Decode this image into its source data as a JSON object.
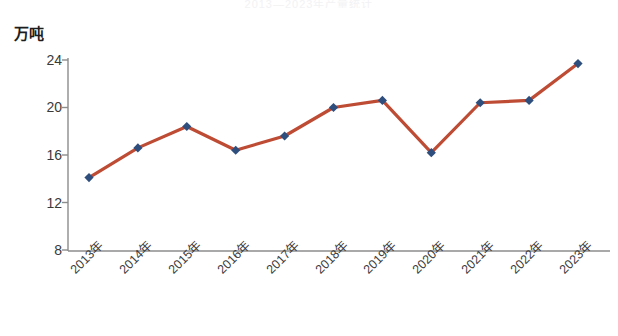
{
  "title_sliver": "2013—2023年产量统计",
  "axis": {
    "y_unit_label": "万吨",
    "y_ticks": [
      "24",
      "20",
      "16",
      "12",
      "8"
    ],
    "x_ticks": [
      "2013年",
      "2014年",
      "2015年",
      "2016年",
      "2017年",
      "2018年",
      "2019年",
      "2020年",
      "2021年",
      "2022年",
      "2023年"
    ]
  },
  "colors": {
    "line": "#be4b34",
    "marker": "#2e4e7e",
    "axis": "#8c8c8c",
    "text": "#3c3c3c"
  },
  "chart_data": {
    "type": "line",
    "title": "",
    "subtitle": "",
    "xlabel": "",
    "ylabel": "万吨",
    "ylim": [
      8,
      24
    ],
    "ytick_values": [
      24,
      20,
      16,
      12,
      8
    ],
    "grid": false,
    "legend": null,
    "categories": [
      "2013年",
      "2014年",
      "2015年",
      "2016年",
      "2017年",
      "2018年",
      "2019年",
      "2020年",
      "2021年",
      "2022年",
      "2023年"
    ],
    "series": [
      {
        "name": "产量",
        "marker": "diamond",
        "values": [
          14.1,
          16.6,
          18.4,
          16.4,
          17.6,
          20.0,
          20.6,
          16.2,
          20.4,
          20.6,
          23.7
        ]
      }
    ]
  }
}
